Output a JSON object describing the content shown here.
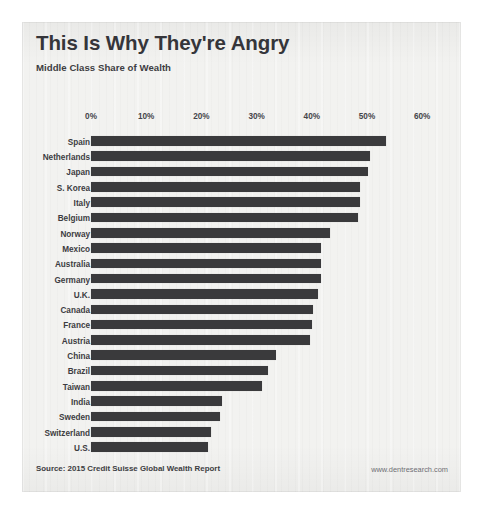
{
  "header": {
    "title": "This Is Why They're Angry",
    "subtitle": "Middle Class Share of Wealth"
  },
  "footer": {
    "source": "Source: 2015 Credit Suisse Global Wealth Report",
    "credit": "www.dentresearch.com"
  },
  "colors": {
    "bar": "#3a3a3c",
    "paper": "#f2f2f0",
    "text": "#3c3c41",
    "page": "#ffffff"
  },
  "chart_data": {
    "type": "bar",
    "orientation": "horizontal",
    "title": "This Is Why They're Angry",
    "subtitle": "Middle Class Share of Wealth",
    "xlabel": "",
    "ylabel": "",
    "xlim": [
      0,
      60
    ],
    "grid": false,
    "legend": false,
    "tick_labels": [
      "0%",
      "10%",
      "20%",
      "30%",
      "40%",
      "50%",
      "60%"
    ],
    "ticks": [
      0,
      10,
      20,
      30,
      40,
      50,
      60
    ],
    "categories": [
      "Spain",
      "Netherlands",
      "Japan",
      "S. Korea",
      "Italy",
      "Belgium",
      "Norway",
      "Mexico",
      "Australia",
      "Germany",
      "U.K.",
      "Canada",
      "France",
      "Austria",
      "China",
      "Brazil",
      "Taiwan",
      "India",
      "Sweden",
      "Switzerland",
      "U.S."
    ],
    "values": [
      53.4,
      50.5,
      50.2,
      48.7,
      48.7,
      48.4,
      43.3,
      41.7,
      41.7,
      41.7,
      41.1,
      40.2,
      40.0,
      39.7,
      33.5,
      32.1,
      31.0,
      23.7,
      23.4,
      21.7,
      21.2
    ]
  }
}
